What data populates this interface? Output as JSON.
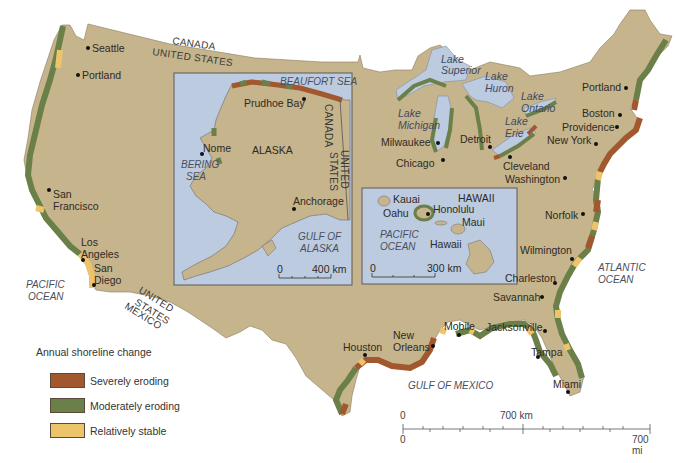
{
  "map": {
    "title": "Annual shoreline change map of the United States",
    "colors": {
      "land": "#c6b48c",
      "water": "#bccbe0",
      "sea": "#ffffff",
      "severely_eroding": "#a2582e",
      "moderately_eroding": "#6b7f48",
      "relatively_stable": "#eec46a",
      "inset_border": "#5a5a5a"
    },
    "borders": {
      "canada": "CANADA",
      "united_states_north": "UNITED STATES",
      "united_states_south_1": "UNITED",
      "united_states_south_2": "STATES",
      "mexico": "MEXICO"
    },
    "oceans": {
      "pacific_1": "PACIFIC",
      "pacific_2": "OCEAN",
      "atlantic_1": "ATLANTIC",
      "atlantic_2": "OCEAN",
      "gulf_of_mexico": "GULF OF MEXICO"
    },
    "lakes": {
      "superior_1": "Lake",
      "superior_2": "Superior",
      "huron_1": "Lake",
      "huron_2": "Huron",
      "ontario_1": "Lake",
      "ontario_2": "Ontario",
      "michigan_1": "Lake",
      "michigan_2": "Michigan",
      "erie_1": "Lake",
      "erie_2": "Erie"
    },
    "cities": {
      "seattle": "Seattle",
      "portland_or": "Portland",
      "san_francisco_1": "San",
      "san_francisco_2": "Francisco",
      "los_angeles_1": "Los",
      "los_angeles_2": "Angeles",
      "san_diego_1": "San",
      "san_diego_2": "Diego",
      "milwaukee": "Milwaukee",
      "chicago": "Chicago",
      "detroit": "Detroit",
      "cleveland": "Cleveland",
      "washington": "Washington",
      "portland_me": "Portland",
      "boston": "Boston",
      "providence": "Providence",
      "new_york": "New York",
      "norfolk": "Norfolk",
      "wilmington": "Wilmington",
      "charleston": "Charleston",
      "savannah": "Savannah",
      "jacksonville": "Jacksonville",
      "tampa": "Tampa",
      "miami": "Miami",
      "mobile": "Mobile",
      "new_orleans_1": "New",
      "new_orleans_2": "Orleans",
      "houston": "Houston"
    },
    "alaska_inset": {
      "state": "ALASKA",
      "beaufort_sea": "BEAUFORT SEA",
      "prudhoe_bay": "Prudhoe Bay",
      "nome": "Nome",
      "bering_sea_1": "BERING",
      "bering_sea_2": "SEA",
      "anchorage": "Anchorage",
      "gulf_of_alaska_1": "GULF OF",
      "gulf_of_alaska_2": "ALASKA",
      "canada": "CANADA",
      "united_states_1": "UNITED",
      "united_states_2": "STATES",
      "scale_zero": "0",
      "scale_label": "400 km"
    },
    "hawaii_inset": {
      "state": "HAWAII",
      "kauai": "Kauai",
      "oahu": "Oahu",
      "honolulu": "Honolulu",
      "maui": "Maui",
      "hawaii": "Hawaii",
      "pacific_1": "PACIFIC",
      "pacific_2": "OCEAN",
      "scale_zero": "0",
      "scale_label": "300 km"
    }
  },
  "legend": {
    "title": "Annual shoreline change",
    "items": [
      {
        "label": "Severely eroding",
        "color": "#a2582e"
      },
      {
        "label": "Moderately eroding",
        "color": "#6b7f48"
      },
      {
        "label": "Relatively stable",
        "color": "#eec46a"
      }
    ]
  },
  "scale_bar": {
    "km_zero": "0",
    "km_label": "700 km",
    "mi_zero": "0",
    "mi_label": "700 mi"
  }
}
